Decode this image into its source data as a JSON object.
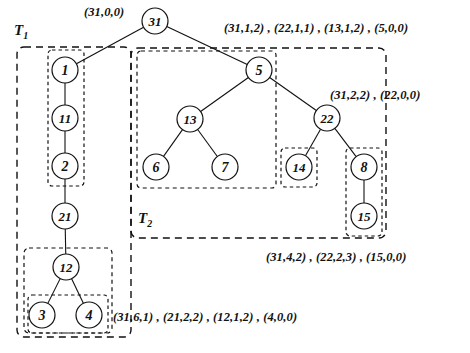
{
  "figure": {
    "background_color": "#ffffff",
    "stroke_color": "#111111"
  },
  "nodes": [
    {
      "id": "n31",
      "label": "31",
      "cx": 155,
      "cy": 21,
      "r": 13
    },
    {
      "id": "n1",
      "label": "1",
      "cx": 65,
      "cy": 70,
      "r": 13
    },
    {
      "id": "n11",
      "label": "11",
      "cx": 65,
      "cy": 118,
      "r": 13
    },
    {
      "id": "n2",
      "label": "2",
      "cx": 65,
      "cy": 166,
      "r": 13
    },
    {
      "id": "n21",
      "label": "21",
      "cx": 65,
      "cy": 216,
      "r": 13
    },
    {
      "id": "n12",
      "label": "12",
      "cx": 66,
      "cy": 267,
      "r": 13
    },
    {
      "id": "n3",
      "label": "3",
      "cx": 42,
      "cy": 315,
      "r": 13
    },
    {
      "id": "n4",
      "label": "4",
      "cx": 89,
      "cy": 315,
      "r": 13
    },
    {
      "id": "n5",
      "label": "5",
      "cx": 259,
      "cy": 70,
      "r": 13
    },
    {
      "id": "n13",
      "label": "13",
      "cx": 190,
      "cy": 119,
      "r": 13
    },
    {
      "id": "n6",
      "label": "6",
      "cx": 156,
      "cy": 167,
      "r": 13
    },
    {
      "id": "n7",
      "label": "7",
      "cx": 225,
      "cy": 167,
      "r": 13
    },
    {
      "id": "n22",
      "label": "22",
      "cx": 327,
      "cy": 118,
      "r": 13
    },
    {
      "id": "n14",
      "label": "14",
      "cx": 299,
      "cy": 167,
      "r": 13
    },
    {
      "id": "n8",
      "label": "8",
      "cx": 364,
      "cy": 167,
      "r": 13
    },
    {
      "id": "n15",
      "label": "15",
      "cx": 364,
      "cy": 216,
      "r": 13
    }
  ],
  "edges": [
    {
      "from": "n31",
      "to": "n1"
    },
    {
      "from": "n31",
      "to": "n5"
    },
    {
      "from": "n1",
      "to": "n11"
    },
    {
      "from": "n11",
      "to": "n2"
    },
    {
      "from": "n2",
      "to": "n21"
    },
    {
      "from": "n21",
      "to": "n12"
    },
    {
      "from": "n12",
      "to": "n3"
    },
    {
      "from": "n12",
      "to": "n4"
    },
    {
      "from": "n5",
      "to": "n13"
    },
    {
      "from": "n5",
      "to": "n22"
    },
    {
      "from": "n13",
      "to": "n6"
    },
    {
      "from": "n13",
      "to": "n7"
    },
    {
      "from": "n22",
      "to": "n14"
    },
    {
      "from": "n22",
      "to": "n8"
    },
    {
      "from": "n8",
      "to": "n15"
    }
  ],
  "boxes": [
    {
      "id": "box-t1-outer",
      "x": 17,
      "y": 47,
      "w": 114,
      "h": 290,
      "rx": 7,
      "dash": "7,5",
      "width": 1.4
    },
    {
      "id": "box-t1-chain",
      "x": 48,
      "y": 50,
      "w": 36,
      "h": 136,
      "rx": 4,
      "dash": "3.5,3",
      "width": 1.2
    },
    {
      "id": "box-t1-bottom",
      "x": 24,
      "y": 248,
      "w": 88,
      "h": 85,
      "rx": 5,
      "dash": "4,3.5",
      "width": 1.2
    },
    {
      "id": "box-t1-leaves",
      "x": 28,
      "y": 295,
      "w": 80,
      "h": 38,
      "rx": 4,
      "dash": "3.5,3",
      "width": 1.2
    },
    {
      "id": "box-t2-outer",
      "x": 131,
      "y": 48,
      "w": 255,
      "h": 190,
      "rx": 7,
      "dash": "7,5",
      "width": 1.4
    },
    {
      "id": "box-t2-left",
      "x": 137,
      "y": 51,
      "w": 139,
      "h": 137,
      "rx": 4,
      "dash": "4,3.5",
      "width": 1.2
    },
    {
      "id": "box-n14",
      "x": 281,
      "y": 148,
      "w": 36,
      "h": 39,
      "rx": 4,
      "dash": "3.5,3",
      "width": 1.2
    },
    {
      "id": "box-n8-15",
      "x": 346,
      "y": 148,
      "w": 36,
      "h": 88,
      "rx": 4,
      "dash": "3.5,3",
      "width": 1.2
    }
  ],
  "tree_labels": [
    {
      "id": "label-t1",
      "name": "T",
      "subscript": "1",
      "x": 14,
      "y": 22
    },
    {
      "id": "label-t2",
      "name": "T",
      "subscript": "2",
      "x": 138,
      "y": 210
    }
  ],
  "annotations": [
    {
      "id": "ann-root",
      "text": "(31,0,0)",
      "x": 84,
      "y": 5
    },
    {
      "id": "ann-t2-top",
      "text": "(31,1,2) , (22,1,1) , (13,1,2) , (5,0,0)",
      "x": 224,
      "y": 21
    },
    {
      "id": "ann-n22",
      "text": "(31,2,2) , (22,0,0)",
      "x": 330,
      "y": 88
    },
    {
      "id": "ann-n15",
      "text": "(31,4,2) , (22,2,3) , (15,0,0)",
      "x": 266,
      "y": 250
    },
    {
      "id": "ann-bottom-left",
      "text": "(31,6,1) , (21,2,2) , (12,1,2) , (4,0,0)",
      "x": 113,
      "y": 310
    }
  ]
}
